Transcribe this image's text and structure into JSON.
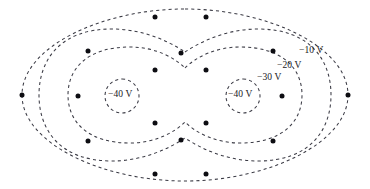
{
  "figure": {
    "kind": "equipotential-contour-map",
    "background_color": "#ffffff",
    "line_color": "#3a3a44",
    "marker_color": "#0d0d12",
    "labels": [
      {
        "id": "v-10",
        "text": "−10 V",
        "x": 299,
        "y": 46
      },
      {
        "id": "v-20",
        "text": "−20 V",
        "x": 277,
        "y": 61
      },
      {
        "id": "v-30",
        "text": "−30 V",
        "x": 257,
        "y": 73
      },
      {
        "id": "v-40-left",
        "text": "−40 V",
        "x": 108,
        "y": 90
      },
      {
        "id": "v-40-right",
        "text": "−40 V",
        "x": 228,
        "y": 90
      }
    ],
    "contours": [
      {
        "id": "contour-10v",
        "value": "−10 V",
        "d": "M 185 9 C 268 9 348 47 348 95 C 348 143 268 181 185 181 C 102 181 22 143 22 95 C 22 47 102 9 185 9 Z"
      },
      {
        "id": "contour-20v",
        "value": "−20 V",
        "d": "M 185 52 C 206 38 232 29 258 29 C 310 29 331 60 331 95 C 331 130 310 161 258 161 C 232 161 206 152 185 138 C 164 152 138 161 112 161 C 60 161 39 130 39 95 C 39 60 60 29 112 29 C 138 29 164 38 185 52 Z"
      },
      {
        "id": "contour-30v",
        "value": "−30 V",
        "d": "M 185 68 C 196 57 216 47 240 47 C 282 47 302 68 302 95 C 302 122 282 143 240 143 C 216 143 196 133 185 122 C 174 133 154 143 130 143 C 88 143 68 122 68 95 C 68 68 88 47 130 47 C 154 47 174 57 185 68 Z"
      },
      {
        "id": "contour-40v-left",
        "value": "−40 V",
        "d": "M 122 79 C 131.3 79 139 86.6 139 96 C 139 105.4 131.3 113 122 113 C 112.7 113 105 105.4 105 96 C 105 86.6 112.7 79 122 79 Z"
      },
      {
        "id": "contour-40v-right",
        "value": "−40 V",
        "d": "M 243 79 C 252.3 79 260 86.6 260 96 C 260 105.4 252.3 113 243 113 C 233.7 113 226 105.4 226 96 C 226 86.6 233.7 79 243 79 Z"
      }
    ],
    "markers": [
      {
        "x": 155,
        "y": 17,
        "r": 2.5,
        "on": "contour-10v"
      },
      {
        "x": 206,
        "y": 17,
        "r": 2.5,
        "on": "contour-10v"
      },
      {
        "x": 155,
        "y": 174,
        "r": 2.5,
        "on": "contour-10v"
      },
      {
        "x": 206,
        "y": 174,
        "r": 2.5,
        "on": "contour-10v"
      },
      {
        "x": 22,
        "y": 95,
        "r": 2.5,
        "on": "contour-10v"
      },
      {
        "x": 348,
        "y": 95,
        "r": 2.5,
        "on": "contour-10v"
      },
      {
        "x": 88,
        "y": 51,
        "r": 2.5,
        "on": "contour-20v"
      },
      {
        "x": 273,
        "y": 51,
        "r": 2.5,
        "on": "contour-20v"
      },
      {
        "x": 88,
        "y": 141,
        "r": 2.5,
        "on": "contour-20v"
      },
      {
        "x": 273,
        "y": 141,
        "r": 2.5,
        "on": "contour-20v"
      },
      {
        "x": 181,
        "y": 53,
        "r": 2.5,
        "on": "contour-20v"
      },
      {
        "x": 181,
        "y": 140,
        "r": 2.5,
        "on": "contour-20v"
      },
      {
        "x": 155,
        "y": 70,
        "r": 2.5,
        "on": "contour-30v"
      },
      {
        "x": 206,
        "y": 70,
        "r": 2.5,
        "on": "contour-30v"
      },
      {
        "x": 155,
        "y": 123,
        "r": 2.5,
        "on": "contour-30v"
      },
      {
        "x": 206,
        "y": 123,
        "r": 2.5,
        "on": "contour-30v"
      },
      {
        "x": 78,
        "y": 96,
        "r": 2.5,
        "on": "contour-30v"
      },
      {
        "x": 282,
        "y": 96,
        "r": 2.5,
        "on": "contour-30v"
      }
    ]
  }
}
